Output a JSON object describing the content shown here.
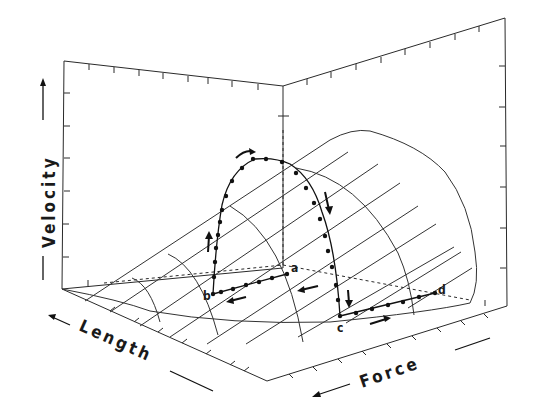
{
  "diagram": {
    "type": "3d-surface-with-trajectory",
    "axes": {
      "x": {
        "label": "Length",
        "direction": "decreasing-toward-left"
      },
      "y": {
        "label": "Force",
        "direction": "decreasing-toward-left"
      },
      "z": {
        "label": "Velocity",
        "direction": "increasing-upward"
      }
    },
    "trajectory": {
      "points": [
        {
          "id": "a",
          "label": "a"
        },
        {
          "id": "b",
          "label": "b"
        },
        {
          "id": "c",
          "label": "c"
        },
        {
          "id": "d",
          "label": "d"
        }
      ],
      "segments": [
        {
          "from": "a",
          "to": "b",
          "direction": "arrow-left",
          "plane": "floor"
        },
        {
          "from": "b",
          "to": "peak",
          "direction": "arrow-up",
          "plane": "surface"
        },
        {
          "from": "peak",
          "to": "c",
          "direction": "arrow-down",
          "plane": "surface"
        },
        {
          "from": "c",
          "to": "d",
          "direction": "arrow-right",
          "plane": "floor"
        }
      ]
    },
    "colors": {
      "ink": "#1a1a1a",
      "background": "#ffffff"
    }
  }
}
